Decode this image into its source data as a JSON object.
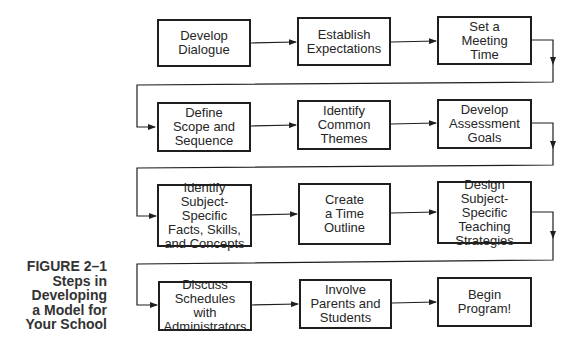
{
  "figure": {
    "caption_lines": [
      "FIGURE 2–1",
      "Steps in",
      "Developing",
      "a Model for",
      "Your School"
    ]
  },
  "steps": [
    {
      "label": "Develop\nDialogue"
    },
    {
      "label": "Establish\nExpectations"
    },
    {
      "label": "Set a\nMeeting\nTime"
    },
    {
      "label": "Define\nScope and\nSequence"
    },
    {
      "label": "Identify\nCommon\nThemes"
    },
    {
      "label": "Develop\nAssessment\nGoals"
    },
    {
      "label": "Identify\nSubject-Specific\nFacts, Skills,\nand Concepts"
    },
    {
      "label": "Create\na Time\nOutline"
    },
    {
      "label": "Design\nSubject-Specific\nTeaching\nStrategies"
    },
    {
      "label": "Discuss\nSchedules with\nAdministrators"
    },
    {
      "label": "Involve\nParents and\nStudents"
    },
    {
      "label": "Begin\nProgram!"
    }
  ],
  "colors": {
    "line": "#1e1e1e",
    "text": "#262626",
    "caption": "#333333"
  }
}
